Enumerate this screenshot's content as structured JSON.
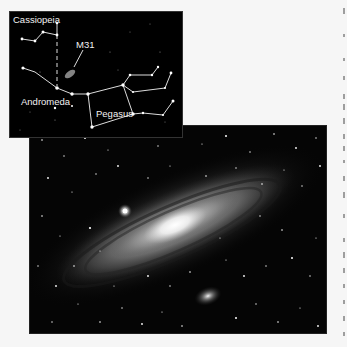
{
  "figure": {
    "inset_chart": {
      "title": "Star chart of Andromeda galaxy location",
      "labels": {
        "cassiopeia": "Cassiopeia",
        "m31": "M31",
        "andromeda": "Andromeda",
        "pegasus": "Pegasus"
      },
      "colors": {
        "background": "#000000",
        "lines": "#dcdcdc",
        "stars": "#ffffff",
        "text": "#f2f2f2"
      }
    },
    "photo": {
      "subject": "Andromeda Galaxy (M31) with companions",
      "colors": {
        "background": "#050505",
        "core": "#ffffff",
        "disk": "#bdbdbd"
      }
    },
    "page": {
      "background": "#f6f6f6"
    }
  }
}
